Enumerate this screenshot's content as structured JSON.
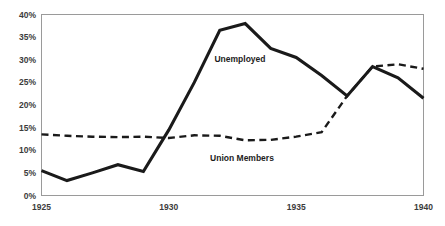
{
  "chart_data": {
    "type": "line",
    "title": "",
    "subtitle": "",
    "xlabel": "",
    "ylabel": "",
    "xlim": [
      1925,
      1940
    ],
    "ylim": [
      0,
      40
    ],
    "grid": false,
    "legend_position": "inline-annotation",
    "x": [
      1925,
      1926,
      1927,
      1928,
      1929,
      1930,
      1931,
      1932,
      1933,
      1934,
      1935,
      1936,
      1937,
      1938,
      1939,
      1940
    ],
    "x_tick_labels": [
      "1925",
      "1930",
      "1935",
      "1940"
    ],
    "x_tick_values": [
      1925,
      1930,
      1935,
      1940
    ],
    "y_tick_labels": [
      "0%",
      "5%",
      "10%",
      "15%",
      "20%",
      "25%",
      "30%",
      "35%",
      "40%"
    ],
    "y_tick_values": [
      0,
      5,
      10,
      15,
      20,
      25,
      30,
      35,
      40
    ],
    "series": [
      {
        "name": "Unemployed",
        "style": "solid",
        "color": "#1a1a1a",
        "label_text": "Unemployed",
        "values": [
          5.5,
          3.3,
          5.0,
          6.8,
          5.3,
          14.5,
          25.0,
          36.5,
          38.0,
          32.5,
          30.5,
          26.5,
          22.0,
          28.5,
          26.0,
          21.5
        ]
      },
      {
        "name": "Union Members",
        "style": "dashed",
        "color": "#1a1a1a",
        "label_text": "Union Members",
        "values": [
          13.5,
          13.2,
          13.0,
          12.9,
          13.0,
          12.7,
          13.3,
          13.2,
          12.2,
          12.3,
          13.0,
          14.0,
          22.0,
          28.5,
          29.0,
          28.0
        ]
      }
    ]
  },
  "axis": {
    "y_labels": [
      "40%",
      "35%",
      "30%",
      "25%",
      "20%",
      "15%",
      "10%",
      "5%",
      "0%"
    ],
    "x_labels": [
      "1925",
      "1930",
      "1935",
      "1940"
    ]
  },
  "annotations": {
    "unemployed_label": "Unemployed",
    "union_label": "Union Members"
  },
  "colors": {
    "line": "#1a1a1a",
    "frame": "#9a9a9a",
    "text": "#3b3b3b",
    "background": "#ffffff"
  }
}
